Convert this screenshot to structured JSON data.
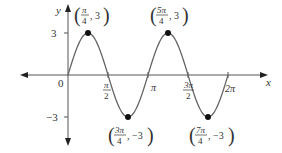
{
  "chart_data": {
    "type": "line",
    "title": "",
    "function": "y = 3 sin(2x)",
    "xlabel": "x",
    "ylabel": "y",
    "xlim": [
      -0.6,
      2.35
    ],
    "ylim": [
      -3.5,
      3.5
    ],
    "grid": false,
    "x_tick_labels": [
      "0",
      "π/2",
      "π",
      "3π/2",
      "2π"
    ],
    "x_tick_values": [
      0,
      0.5,
      1,
      1.5,
      2
    ],
    "x_tick_units": "multiples of π",
    "y_tick_labels": [
      "3",
      "−3"
    ],
    "y_tick_values": [
      3,
      -3
    ],
    "series": [
      {
        "name": "curve",
        "x_in_pi": [
          0,
          0.25,
          0.5,
          0.75,
          1,
          1.25,
          1.5,
          1.75,
          2
        ],
        "y": [
          0,
          3,
          0,
          -3,
          0,
          3,
          0,
          -3,
          0
        ]
      }
    ],
    "annotations": [
      {
        "point": [
          0.25,
          3
        ],
        "label_num": "π",
        "label_den": "4",
        "label_y": "3"
      },
      {
        "point": [
          1.25,
          3
        ],
        "label_num": "5π",
        "label_den": "4",
        "label_y": "3"
      },
      {
        "point": [
          0.75,
          -3
        ],
        "label_num": "3π",
        "label_den": "4",
        "label_y": "−3"
      },
      {
        "point": [
          1.75,
          -3
        ],
        "label_num": "7π",
        "label_den": "4",
        "label_y": "−3"
      }
    ]
  },
  "labels": {
    "x_axis": "x",
    "y_axis": "y",
    "origin": "0",
    "y_pos": "3",
    "y_neg": "−3",
    "tick_pi": "π",
    "tick_2pi": "2π",
    "tick_half_num": "π",
    "tick_half_den": "2",
    "tick_3half_num": "3π",
    "tick_3half_den": "2",
    "peak1_num": "π",
    "peak1_den": "4",
    "peak1_y": ", 3",
    "peak2_num": "5π",
    "peak2_den": "4",
    "peak2_y": ", 3",
    "trough1_num": "3π",
    "trough1_den": "4",
    "trough1_y": ", −3",
    "trough2_num": "7π",
    "trough2_den": "4",
    "trough2_y": ", −3"
  }
}
